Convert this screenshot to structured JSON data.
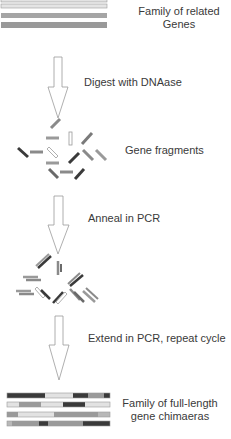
{
  "colors": {
    "light": "#e2e2e2",
    "mid": "#9a9a9a",
    "midlight": "#b8b8b8",
    "dark": "#3a3a3a",
    "arrow_stroke": "#9a9a9a",
    "text": "#3a3a3a"
  },
  "steps": [
    {
      "id": "start",
      "label_line1": "Family of related",
      "label_line2": "Genes"
    },
    {
      "id": "digest",
      "label": "Digest with DNAase"
    },
    {
      "id": "fragments",
      "label": "Gene fragments"
    },
    {
      "id": "anneal",
      "label": "Anneal in PCR"
    },
    {
      "id": "extend",
      "label": "Extend  in PCR, repeat cycle"
    },
    {
      "id": "result",
      "label_line1": "Family of full-length",
      "label_line2": "gene chimaeras"
    }
  ],
  "parent_genes": [
    {
      "shade": "light"
    },
    {
      "shade": "light"
    },
    {
      "shade": "mid"
    },
    {
      "shade": "mid"
    }
  ],
  "chimaeras": [
    {
      "segments": [
        [
          "dark",
          38
        ],
        [
          "light",
          28
        ],
        [
          "dark",
          15
        ],
        [
          "mid",
          16
        ],
        [
          "dark",
          6
        ]
      ]
    },
    {
      "segments": [
        [
          "light",
          12
        ],
        [
          "mid",
          22
        ],
        [
          "light",
          22
        ],
        [
          "dark",
          22
        ],
        [
          "light",
          25
        ]
      ]
    },
    {
      "segments": [
        [
          "mid",
          11
        ],
        [
          "light",
          36
        ],
        [
          "mid",
          44
        ],
        [
          "midlight",
          12
        ]
      ]
    },
    {
      "segments": [
        [
          "midlight",
          5
        ],
        [
          "mid",
          27
        ],
        [
          "dark",
          9
        ],
        [
          "mid",
          35
        ],
        [
          "dark",
          27
        ]
      ]
    }
  ]
}
